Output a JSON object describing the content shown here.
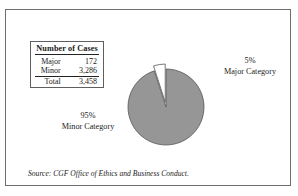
{
  "figure": {
    "source_note_lead": "Source:",
    "source_note_text": " CGF Office of Ethics and Business Conduct.",
    "frame_color": "#6e6e6e",
    "background": "#ffffff"
  },
  "table": {
    "title": "Number of Cases",
    "rows": [
      {
        "label": "Major",
        "value": "172"
      },
      {
        "label": "Minor",
        "value": "3,286"
      }
    ],
    "total": {
      "label": "Total",
      "value": "3,458"
    }
  },
  "labels": {
    "major": {
      "percent": "5%",
      "category": "Major Category"
    },
    "minor": {
      "percent": "95%",
      "category": "Minor Category"
    }
  },
  "chart_data": {
    "type": "pie",
    "title": "Number of Cases",
    "categories": [
      "Minor Category",
      "Major Category"
    ],
    "values": [
      3286,
      172
    ],
    "percents": [
      95,
      5
    ],
    "labels": [
      "95%\nMinor Category",
      "5%\nMajor Category"
    ],
    "colors": [
      "#969696",
      "#ffffff"
    ],
    "exploded": [
      false,
      true
    ],
    "start_angle_deg": 90,
    "direction": "clockwise",
    "slice_border_color": "#555555",
    "legend": "none",
    "grid": false,
    "total": 3458
  }
}
